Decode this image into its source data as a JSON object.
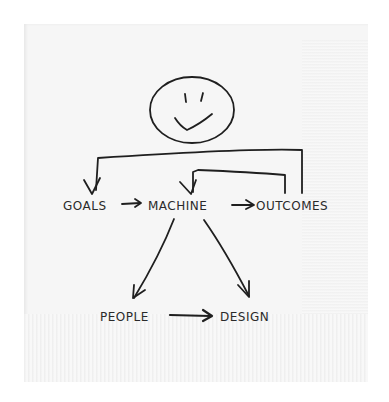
{
  "diagram": {
    "medium": "hand-drawn sketch on paper napkin",
    "ink_color": "#1f1f1f",
    "napkin_color": "#f6f6f6",
    "nodes": {
      "face": {
        "label": "",
        "shape": "smiley-face"
      },
      "goals": {
        "label": "GOALS"
      },
      "machine": {
        "label": "MACHINE"
      },
      "outcomes": {
        "label": "OUTCOMES"
      },
      "people": {
        "label": "PEOPLE"
      },
      "design": {
        "label": "DESIGN"
      }
    },
    "edges": [
      {
        "from": "face",
        "to": "goals",
        "style": "bracket"
      },
      {
        "from": "goals",
        "to": "machine"
      },
      {
        "from": "machine",
        "to": "outcomes"
      },
      {
        "from": "outcomes",
        "to": "machine",
        "style": "feedback-bracket"
      },
      {
        "from": "machine",
        "to": "people"
      },
      {
        "from": "machine",
        "to": "design"
      },
      {
        "from": "people",
        "to": "design"
      }
    ]
  }
}
